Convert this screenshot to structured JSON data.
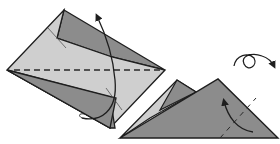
{
  "diagram": {
    "type": "origami-instruction-step",
    "colors": {
      "background": "#ffffff",
      "paper_light": "#cfcfcf",
      "paper_dark": "#8c8c8c",
      "paper_mid": "#a8a8a8",
      "stroke": "#1e1e1e"
    },
    "elements": [
      {
        "id": "folded-model",
        "description": "diamond-shaped folded paper with valley fold line along horizontal axis"
      },
      {
        "id": "valley-fold-line",
        "style": "dashed"
      },
      {
        "id": "fold-arrow-up",
        "description": "curved arrow indicating fold upward"
      },
      {
        "id": "result-triangle",
        "description": "result after folding in half: triangle"
      },
      {
        "id": "inside-reverse-fold-arrow",
        "description": "curved arrow on triangle"
      },
      {
        "id": "turn-over-symbol",
        "description": "loop arrow indicating turn model over"
      }
    ]
  }
}
